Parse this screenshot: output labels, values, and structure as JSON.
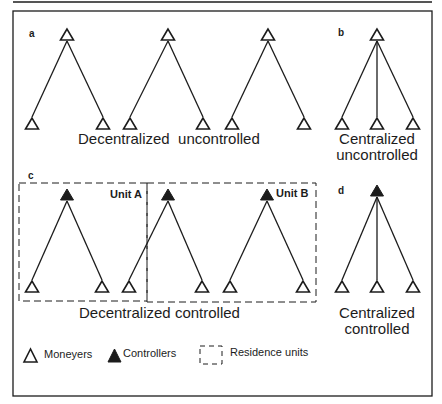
{
  "figure": {
    "ink_color": "#1c1c1c",
    "background": "#ffffff",
    "top_rule": {
      "x1": 13,
      "x2": 432,
      "y": 2
    },
    "frame": {
      "x": 13,
      "y": 11,
      "width": 419,
      "height": 385
    }
  },
  "panels": {
    "a": {
      "letter": "a",
      "caption": "Decentralized  uncontrolled",
      "trees": [
        {
          "top": {
            "x": 67,
            "y": 29,
            "type": "moneyer"
          },
          "leaves": [
            {
              "x": 32,
              "y": 118,
              "type": "moneyer"
            },
            {
              "x": 103,
              "y": 118,
              "type": "moneyer"
            }
          ]
        },
        {
          "top": {
            "x": 168,
            "y": 29,
            "type": "moneyer"
          },
          "leaves": [
            {
              "x": 130,
              "y": 118,
              "type": "moneyer"
            },
            {
              "x": 203,
              "y": 118,
              "type": "moneyer"
            }
          ]
        },
        {
          "top": {
            "x": 268,
            "y": 29,
            "type": "moneyer"
          },
          "leaves": [
            {
              "x": 232,
              "y": 118,
              "type": "moneyer"
            },
            {
              "x": 304,
              "y": 118,
              "type": "moneyer"
            }
          ]
        }
      ]
    },
    "b": {
      "letter": "b",
      "caption_line1": "Centralized",
      "caption_line2": "uncontrolled",
      "trees": [
        {
          "top": {
            "x": 377,
            "y": 29,
            "type": "moneyer"
          },
          "leaves": [
            {
              "x": 342,
              "y": 118,
              "type": "moneyer"
            },
            {
              "x": 377,
              "y": 118,
              "type": "moneyer"
            },
            {
              "x": 413,
              "y": 118,
              "type": "moneyer"
            }
          ]
        }
      ]
    },
    "c": {
      "letter": "c",
      "caption": "Decentralized controlled",
      "unit_a_label": "Unit A",
      "unit_b_label": "Unit B",
      "unit_a_box": {
        "x": 19,
        "y": 183,
        "width": 128,
        "height": 118
      },
      "unit_b_box": {
        "x": 147,
        "y": 183,
        "width": 169,
        "height": 119
      },
      "trees": [
        {
          "top": {
            "x": 67,
            "y": 189,
            "type": "controller"
          },
          "leaves": [
            {
              "x": 32,
              "y": 281,
              "type": "moneyer"
            },
            {
              "x": 102,
              "y": 281,
              "type": "moneyer"
            }
          ]
        },
        {
          "top": {
            "x": 168,
            "y": 189,
            "type": "controller"
          },
          "leaves": [
            {
              "x": 129,
              "y": 281,
              "type": "moneyer"
            },
            {
              "x": 202,
              "y": 281,
              "type": "moneyer"
            }
          ]
        },
        {
          "top": {
            "x": 267,
            "y": 189,
            "type": "controller"
          },
          "leaves": [
            {
              "x": 230,
              "y": 281,
              "type": "moneyer"
            },
            {
              "x": 303,
              "y": 281,
              "type": "moneyer"
            }
          ]
        }
      ]
    },
    "d": {
      "letter": "d",
      "caption_line1": "Centralized",
      "caption_line2": "controlled",
      "trees": [
        {
          "top": {
            "x": 377,
            "y": 185,
            "type": "controller"
          },
          "leaves": [
            {
              "x": 342,
              "y": 281,
              "type": "moneyer"
            },
            {
              "x": 377,
              "y": 281,
              "type": "moneyer"
            },
            {
              "x": 413,
              "y": 281,
              "type": "moneyer"
            }
          ]
        }
      ]
    }
  },
  "legend": {
    "items": [
      {
        "label": "Moneyers",
        "symbol": "open-triangle"
      },
      {
        "label": "Controllers",
        "symbol": "filled-triangle"
      },
      {
        "label": "Residence units",
        "symbol": "dashed-box"
      }
    ]
  }
}
